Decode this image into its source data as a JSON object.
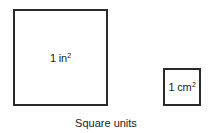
{
  "diagram": {
    "squares": [
      {
        "unit_label": "1 in",
        "exponent": "2",
        "description": "one square inch"
      },
      {
        "unit_label": "1 cm",
        "exponent": "2",
        "description": "one square centimeter"
      }
    ],
    "caption": "Square units"
  }
}
